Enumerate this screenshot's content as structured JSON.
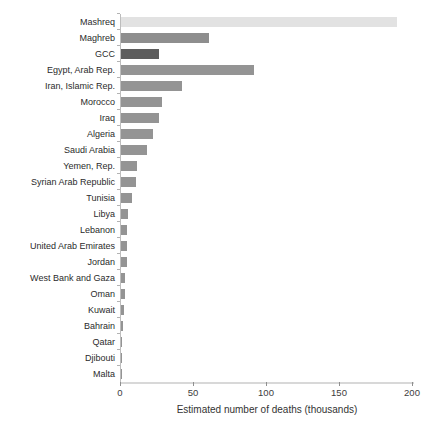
{
  "chart_data": {
    "type": "bar",
    "orientation": "horizontal",
    "title": "",
    "xlabel": "Estimated number of deaths (thousands)",
    "ylabel": "",
    "xlim": [
      0,
      200
    ],
    "x_ticks": [
      0,
      50,
      100,
      150,
      200
    ],
    "grid": false,
    "legend": "none",
    "categories": [
      "Mashreq",
      "Maghreb",
      "GCC",
      "Egypt, Arab Rep.",
      "Iran, Islamic Rep.",
      "Morocco",
      "Iraq",
      "Algeria",
      "Saudi Arabia",
      "Yemen, Rep.",
      "Syrian Arab Republic",
      "Tunisia",
      "Libya",
      "Lebanon",
      "United Arab Emirates",
      "Jordan",
      "West Bank and Gaza",
      "Oman",
      "Kuwait",
      "Bahrain",
      "Qatar",
      "Djibouti",
      "Malta"
    ],
    "values": [
      189,
      60,
      26,
      91,
      42,
      28,
      26,
      22,
      18,
      11,
      10.5,
      7.5,
      4.5,
      4,
      4,
      4,
      3,
      2.5,
      2,
      1.2,
      0.8,
      0.7,
      0.4
    ],
    "groups": [
      "mashreq",
      "maghreb",
      "gcc",
      "country",
      "country",
      "country",
      "country",
      "country",
      "country",
      "country",
      "country",
      "country",
      "country",
      "country",
      "country",
      "country",
      "country",
      "country",
      "country",
      "country",
      "country",
      "country",
      "country"
    ],
    "bar_colors": {
      "mashreq": "#e2e2e2",
      "maghreb": "#8e8e8e",
      "gcc": "#5d5d5d",
      "country": "#949494"
    },
    "axis_colors": {
      "axis_line": "#d8d8d8",
      "y_axis_line": "#bdbdbd",
      "tick": "#8f8f8f",
      "label_text": "#2b2b2b",
      "tick_text": "#3d3d3d"
    }
  }
}
